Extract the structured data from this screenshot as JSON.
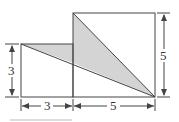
{
  "diagram": {
    "small_square": {
      "side_label": "3",
      "x": 21,
      "y": 44,
      "size": 52
    },
    "large_square": {
      "side_label": "5",
      "x": 73,
      "y": 13,
      "size": 84
    },
    "labels": {
      "left_height": "3",
      "bottom_small": "3",
      "bottom_large": "5",
      "right_height": "5"
    },
    "colors": {
      "stroke": "#444444",
      "shade": "#d4d4d4"
    }
  }
}
